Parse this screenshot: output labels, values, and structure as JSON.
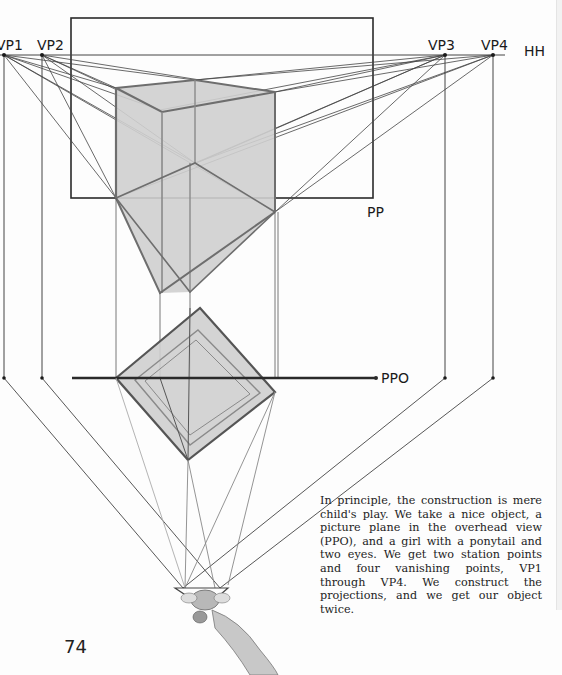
{
  "labels": {
    "vp1": "VP1",
    "vp2": "VP2",
    "vp3": "VP3",
    "vp4": "VP4",
    "hh": "HH",
    "pp": "PP",
    "ppo": "PPO"
  },
  "caption": "In principle, the construction is mere child's play. We take a nice object, a picture plane in the overhead view (PPO), and a girl with a ponytail and two eyes. We get two station points and four vanishing points, VP1 through VP4. We construct the projections, and we get our object twice.",
  "page_number": "74",
  "colors": {
    "line": "#2a2a2a",
    "thin_line": "#555555",
    "object_fill": "#cfcfcf",
    "object_edge": "#6e6e6e",
    "paper": "#fdfdfd"
  }
}
